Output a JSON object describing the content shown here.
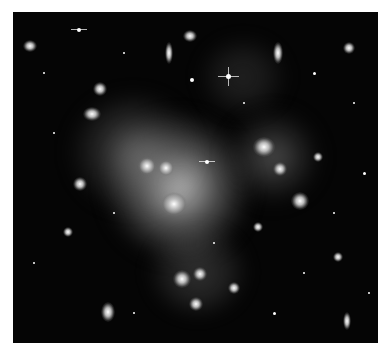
{
  "image": {
    "subject": "galaxy cluster deep field",
    "colors": {
      "background": "#050505",
      "glow": "#d8d8d8",
      "border": "#ffffff"
    }
  }
}
